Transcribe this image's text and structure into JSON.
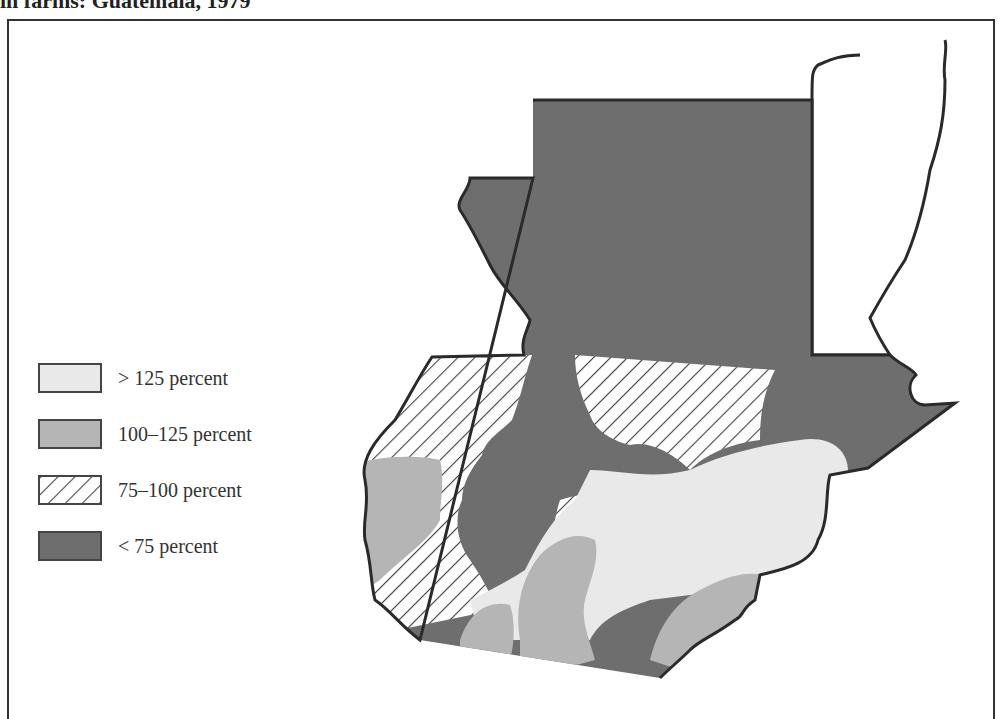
{
  "title": "in farms: Guatemala, 1979",
  "colors": {
    "over_125": "#e9e9e9",
    "from_100_to_125": "#b5b5b5",
    "hatch_line": "#444444",
    "under_75": "#6e6e6e",
    "border": "#2a2a2a"
  },
  "legend": {
    "items": [
      {
        "label": "> 125 percent",
        "pattern": "light-gray"
      },
      {
        "label": "100–125 percent",
        "pattern": "medium-gray"
      },
      {
        "label": "75–100 percent",
        "pattern": "diagonal-hatch"
      },
      {
        "label": "< 75 percent",
        "pattern": "dark-gray"
      }
    ]
  },
  "map": {
    "country": "Guatemala",
    "year": "1979",
    "regions": [
      {
        "name": "Petén (north)",
        "category": "< 75 percent"
      },
      {
        "name": "Central highlands corridor",
        "category": "< 75 percent"
      },
      {
        "name": "Eastern Izabal region",
        "category": "< 75 percent"
      },
      {
        "name": "Western highlands",
        "category": "75–100 percent"
      },
      {
        "name": "North-central highlands",
        "category": "75–100 percent"
      },
      {
        "name": "South-central band",
        "category": "75–100 percent"
      },
      {
        "name": "Southwest coast",
        "category": "100–125 percent"
      },
      {
        "name": "Central south",
        "category": "100–125 percent"
      },
      {
        "name": "Southeast coast",
        "category": "100–125 percent"
      },
      {
        "name": "Eastern region",
        "category": "> 125 percent"
      },
      {
        "name": "Southern coastal strip",
        "category": "> 125 percent"
      }
    ]
  }
}
